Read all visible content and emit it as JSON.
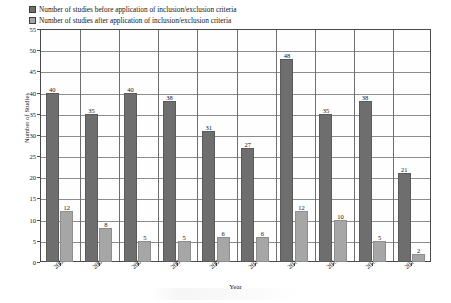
{
  "chart_data": {
    "type": "bar",
    "title": "",
    "xlabel": "Year",
    "ylabel": "Number of Studies",
    "categories": [
      "2005",
      "2006",
      "2007",
      "2008",
      "2009",
      "2010",
      "2011",
      "2012",
      "2013",
      "2014"
    ],
    "ylim": [
      0,
      55
    ],
    "yticks": [
      0,
      5,
      10,
      15,
      20,
      25,
      30,
      35,
      40,
      45,
      50,
      55
    ],
    "grid": true,
    "legend_position": "top-left",
    "series": [
      {
        "name": "Number of studies before application of inclusion/exclusion criteria",
        "color": "#6e6e6e",
        "values": [
          40,
          35,
          40,
          38,
          31,
          27,
          48,
          35,
          38,
          21
        ]
      },
      {
        "name": "Number of studies after application of inclusion/exclusion criteria",
        "color": "#a6a6a6",
        "values": [
          12,
          8,
          5,
          5,
          6,
          6,
          12,
          10,
          5,
          2
        ]
      }
    ]
  }
}
